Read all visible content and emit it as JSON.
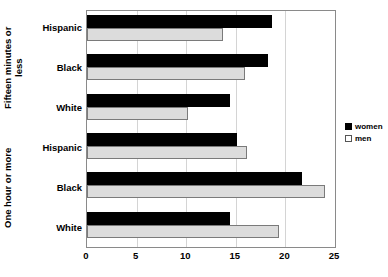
{
  "chart_data": {
    "type": "bar",
    "orientation": "horizontal",
    "title": "",
    "xlabel": "",
    "ylabel": "",
    "xlim": [
      0,
      25
    ],
    "xticks": [
      0,
      5,
      10,
      15,
      20,
      25
    ],
    "xtick_labels": [
      "0",
      "5",
      "10",
      "15",
      "20",
      "25"
    ],
    "grid": true,
    "legend_position": "right",
    "groups": [
      {
        "label": "Fifteen minutes or\nless",
        "categories": [
          "Hispanic",
          "Black",
          "White"
        ]
      },
      {
        "label": "One hour or more",
        "categories": [
          "Hispanic",
          "Black",
          "White"
        ]
      }
    ],
    "categories": [
      "Fifteen minutes or less - Hispanic",
      "Fifteen minutes or less - Black",
      "Fifteen minutes or less - White",
      "One hour or more - Hispanic",
      "One hour or more - Black",
      "One hour or more - White"
    ],
    "series": [
      {
        "name": "women",
        "color": "#000000",
        "values": [
          18.6,
          18.2,
          14.4,
          15.1,
          21.7,
          14.4
        ]
      },
      {
        "name": "men",
        "color": "#dcdcdc",
        "values": [
          13.7,
          15.9,
          10.2,
          16.1,
          24.0,
          19.4
        ]
      }
    ]
  },
  "legend": {
    "items": [
      {
        "label": "women",
        "swatch": "filled-black-square"
      },
      {
        "label": "men",
        "swatch": "open-white-square"
      }
    ]
  },
  "colors": {
    "women_bar": "#000000",
    "men_bar": "#dcdcdc",
    "men_bar_border": "#7a7a7a",
    "gridline": "#d4d4d4",
    "frame": "#8a8a8a",
    "background": "#ffffff",
    "text": "#000000"
  }
}
